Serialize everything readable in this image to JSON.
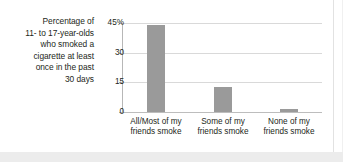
{
  "figure": {
    "caption_lines": [
      "Percentage of",
      "11- to 17-year-olds",
      "who smoked a",
      "cigarette at least",
      "once in the past",
      "30 days"
    ]
  },
  "chart_data": {
    "type": "bar",
    "title": "",
    "subtitle": "",
    "xlabel": "",
    "ylabel": "Percentage of 11- to 17-year-olds who smoked a cigarette at least once in the past 30 days",
    "categories": [
      "All/Most of my friends smoke",
      "Some of my friends smoke",
      "None of my friends smoke"
    ],
    "category_lines": [
      [
        "All/Most of my",
        "friends smoke"
      ],
      [
        "Some of my",
        "friends smoke"
      ],
      [
        "None of my",
        "friends smoke"
      ]
    ],
    "values": [
      44,
      12.5,
      1.5
    ],
    "ylim": [
      0,
      45
    ],
    "yticks": [
      0,
      15,
      30,
      45
    ],
    "ytick_labels": [
      "0",
      "15",
      "30",
      "45%"
    ],
    "grid": true,
    "legend": false,
    "bar_color": "#9a9a9a",
    "gridline_color": "#d9d9d9",
    "axis_color": "#b7b7b7",
    "background": "#ffffff"
  }
}
